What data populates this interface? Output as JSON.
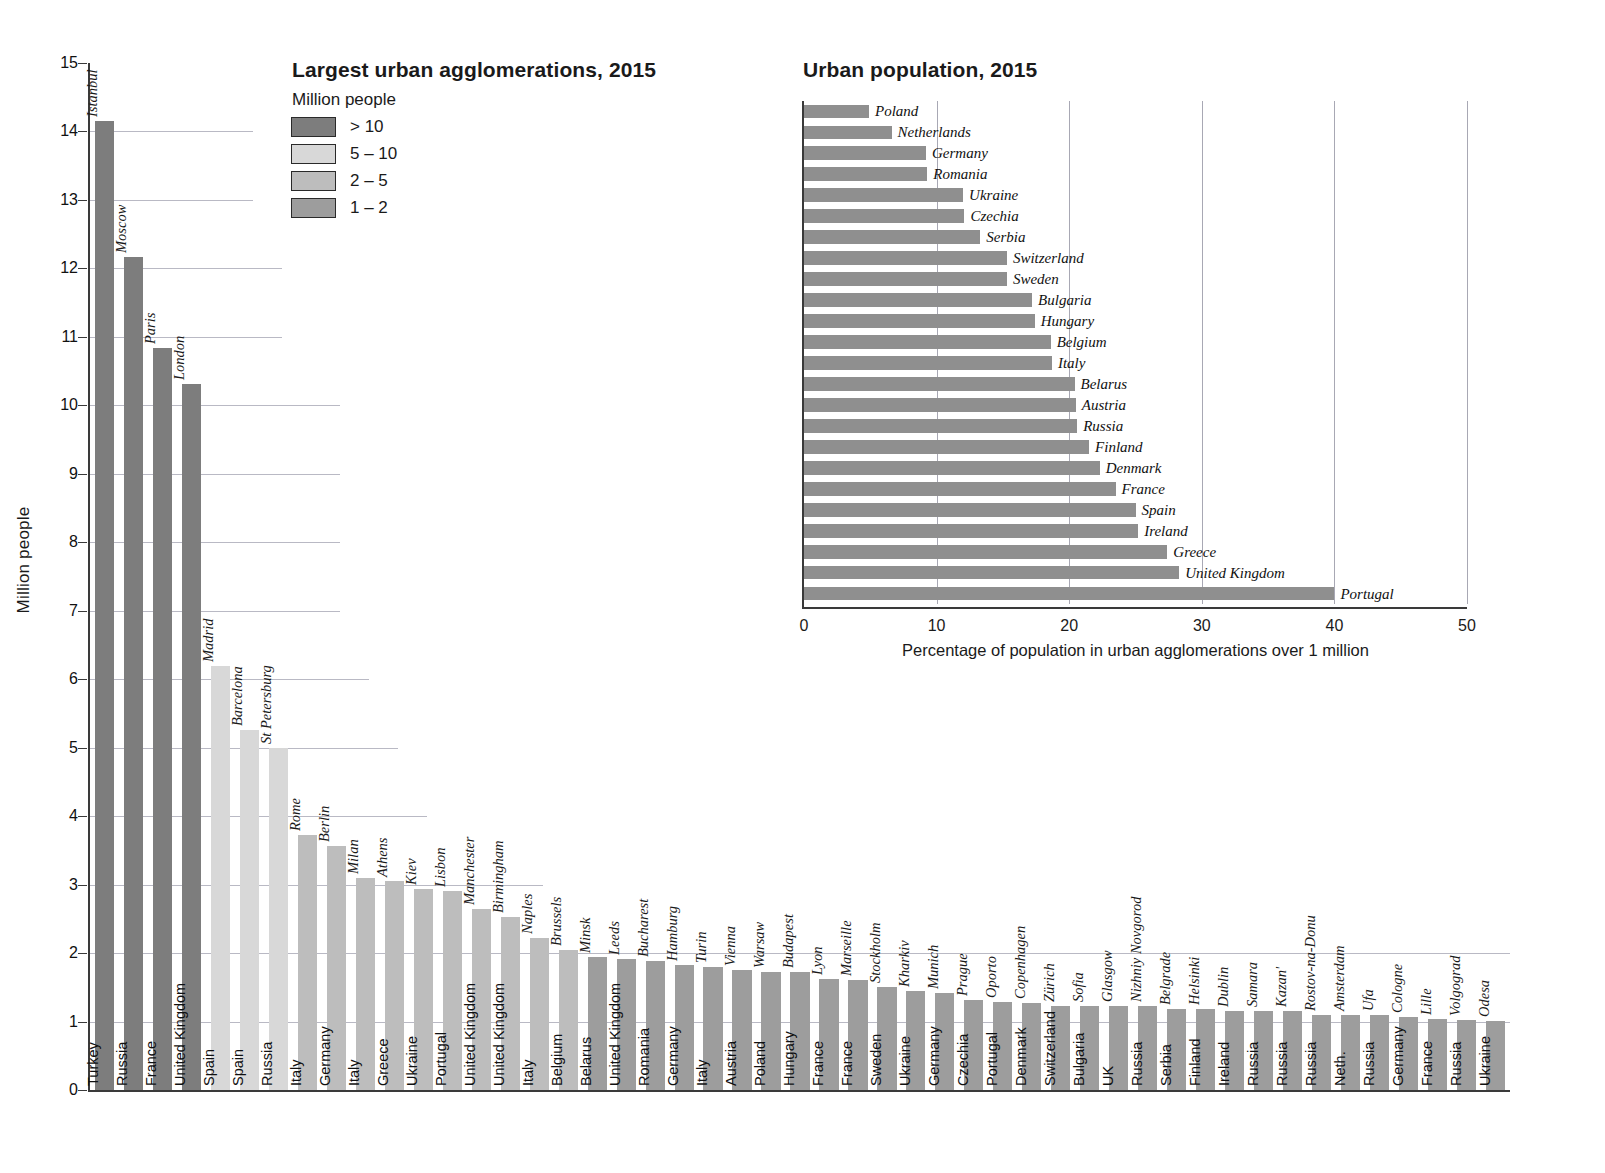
{
  "left": {
    "title": "Largest urban agglomerations, 2015",
    "legend_unit": "Million people",
    "legend": [
      {
        "label": "> 10",
        "color": "#7d7d7d"
      },
      {
        "label": "5 – 10",
        "color": "#d8d8d8"
      },
      {
        "label": "2 – 5",
        "color": "#bdbdbd"
      },
      {
        "label": "1 – 2",
        "color": "#9d9d9d"
      }
    ],
    "ylabel": "Million people",
    "yticks": [
      "0",
      "1",
      "2",
      "3",
      "4",
      "5",
      "6",
      "7",
      "8",
      "9",
      "10",
      "11",
      "12",
      "13",
      "14",
      "15"
    ]
  },
  "right": {
    "title": "Urban population, 2015",
    "xlabel": "Percentage of population in urban agglomerations over 1 million",
    "xticks": [
      "0",
      "10",
      "20",
      "30",
      "40",
      "50"
    ]
  },
  "chart_data": [
    {
      "type": "bar",
      "title": "Largest urban agglomerations, 2015",
      "xlabel": "",
      "ylabel": "Million people",
      "ylim": [
        0,
        15
      ],
      "legend_title": "Million people",
      "legend": [
        "> 10",
        "5 – 10",
        "2 – 5",
        "1 – 2"
      ],
      "categories": [
        "Istanbul",
        "Moscow",
        "Paris",
        "London",
        "Madrid",
        "Barcelona",
        "St Petersburg",
        "Rome",
        "Berlin",
        "Milan",
        "Athens",
        "Kiev",
        "Lisbon",
        "Manchester",
        "Birmingham",
        "Naples",
        "Brussels",
        "Minsk",
        "Leeds",
        "Bucharest",
        "Hamburg",
        "Turin",
        "Vienna",
        "Warsaw",
        "Budapest",
        "Lyon",
        "Marseille",
        "Stockholm",
        "Kharkiv",
        "Munich",
        "Prague",
        "Oporto",
        "Copenhagen",
        "Zürich",
        "Sofia",
        "Glasgow",
        "Nizhniy Novgorod",
        "Belgrade",
        "Helsinki",
        "Dublin",
        "Samara",
        "Kazan'",
        "Rostov-na-Donu",
        "Amsterdam",
        "Ufa",
        "Cologne",
        "Lille",
        "Volgograd",
        "Odesa"
      ],
      "countries": [
        "Turkey",
        "Russia",
        "France",
        "United Kingdom",
        "Spain",
        "Spain",
        "Russia",
        "Italy",
        "Germany",
        "Italy",
        "Greece",
        "Ukraine",
        "Portugal",
        "United Kingdom",
        "United Kingdom",
        "Italy",
        "Belgium",
        "Belarus",
        "United Kingdom",
        "Romania",
        "Germany",
        "Italy",
        "Austria",
        "Poland",
        "Hungary",
        "France",
        "France",
        "Sweden",
        "Ukraine",
        "Germany",
        "Czechia",
        "Portugal",
        "Denmark",
        "Switzerland",
        "Bulgaria",
        "UK",
        "Russia",
        "Serbia",
        "Finland",
        "Ireland",
        "Russia",
        "Russia",
        "Russia",
        "Neth.",
        "Russia",
        "Germany",
        "France",
        "Russia",
        "Ukraine"
      ],
      "values": [
        14.16,
        12.16,
        10.84,
        10.31,
        6.2,
        5.26,
        4.99,
        3.72,
        3.56,
        3.1,
        3.05,
        2.94,
        2.9,
        2.65,
        2.52,
        2.22,
        2.05,
        1.94,
        1.92,
        1.88,
        1.83,
        1.79,
        1.75,
        1.72,
        1.72,
        1.62,
        1.6,
        1.5,
        1.44,
        1.42,
        1.31,
        1.28,
        1.27,
        1.23,
        1.23,
        1.23,
        1.22,
        1.18,
        1.18,
        1.16,
        1.16,
        1.16,
        1.1,
        1.1,
        1.1,
        1.06,
        1.04,
        1.02,
        1.01
      ],
      "color_classes": [
        0,
        0,
        0,
        0,
        1,
        1,
        1,
        2,
        2,
        2,
        2,
        2,
        2,
        2,
        2,
        2,
        2,
        3,
        3,
        3,
        3,
        3,
        3,
        3,
        3,
        3,
        3,
        3,
        3,
        3,
        3,
        3,
        3,
        3,
        3,
        3,
        3,
        3,
        3,
        3,
        3,
        3,
        3,
        3,
        3,
        3,
        3,
        3,
        3
      ]
    },
    {
      "type": "bar",
      "orientation": "horizontal",
      "title": "Urban population, 2015",
      "xlabel": "Percentage of population in urban agglomerations over 1 million",
      "ylabel": "",
      "xlim": [
        0,
        50
      ],
      "categories": [
        "Poland",
        "Netherlands",
        "Germany",
        "Romania",
        "Ukraine",
        "Czechia",
        "Serbia",
        "Switzerland",
        "Sweden",
        "Bulgaria",
        "Hungary",
        "Belgium",
        "Italy",
        "Belarus",
        "Austria",
        "Russia",
        "Finland",
        "Denmark",
        "France",
        "Spain",
        "Ireland",
        "Greece",
        "United Kingdom",
        "Portugal"
      ],
      "values": [
        4.9,
        6.6,
        9.2,
        9.3,
        12.0,
        12.1,
        13.3,
        15.3,
        15.3,
        17.2,
        17.4,
        18.6,
        18.7,
        20.4,
        20.5,
        20.6,
        21.5,
        22.3,
        23.5,
        25.0,
        25.2,
        27.4,
        28.3,
        40.0
      ],
      "bar_color": "#8f8f8f",
      "grid": "vertical"
    }
  ]
}
